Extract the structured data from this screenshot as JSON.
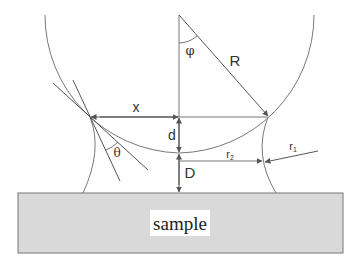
{
  "figure": {
    "colors": {
      "line": "#666666",
      "sample_fill": "#d9d9d9",
      "sample_border": "#777777",
      "label_bg": "#ffffff"
    }
  },
  "labels": {
    "phi": "φ",
    "R": "R",
    "x": "x",
    "d": "d",
    "theta": "θ",
    "D": "D",
    "r1": "r",
    "r1_sub": "1",
    "r2": "r",
    "r2_sub": "2",
    "sample": "sample"
  }
}
